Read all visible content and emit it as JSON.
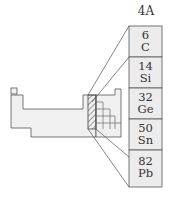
{
  "group": {
    "label": "4A"
  },
  "elements": [
    {
      "number": "6",
      "symbol": "C"
    },
    {
      "number": "14",
      "symbol": "Si"
    },
    {
      "number": "32",
      "symbol": "Ge"
    },
    {
      "number": "50",
      "symbol": "Sn"
    },
    {
      "number": "82",
      "symbol": "Pb"
    }
  ],
  "colors": {
    "box_fill": "#ececec",
    "line": "#555555",
    "table_fill": "#f0f0f0"
  }
}
